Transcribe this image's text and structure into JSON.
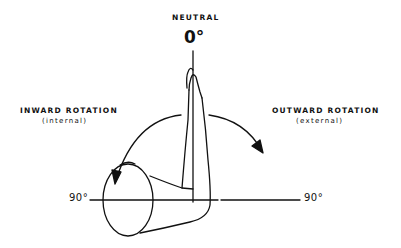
{
  "diagram": {
    "top_label": "NEUTRAL",
    "top_angle": "0°",
    "left_label": "INWARD ROTATION",
    "left_sublabel": "(internal)",
    "right_label": "OUTWARD ROTATION",
    "right_sublabel": "(external)",
    "left_angle": "90°",
    "right_angle": "90°",
    "colors": {
      "line": "#111111",
      "background": "#ffffff"
    },
    "icons": [
      "arm-figure-icon",
      "left-rotation-arrow-icon",
      "right-rotation-arrow-icon"
    ]
  }
}
